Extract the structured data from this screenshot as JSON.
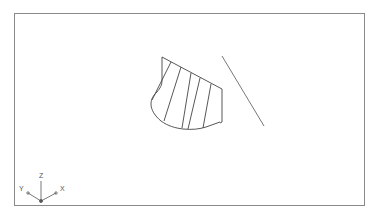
{
  "viewport": {
    "frame_color": "#8a8a8a",
    "line_color": "#444444"
  },
  "ucs_icon": {
    "z_label": "Z",
    "y_label": "Y",
    "x_label": "X"
  }
}
